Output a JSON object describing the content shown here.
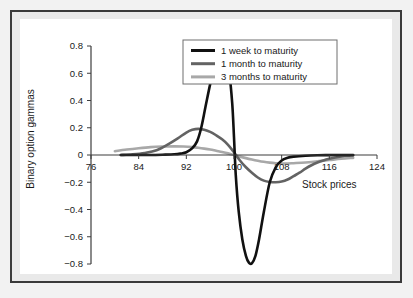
{
  "chart_data": {
    "type": "line",
    "title": "",
    "xlabel": "Stock prices",
    "ylabel": "Binary option gammas",
    "xlim": [
      76,
      124
    ],
    "ylim": [
      -0.8,
      0.8
    ],
    "grid": false,
    "legend_position": "top-right",
    "xticks": [
      "76",
      "84",
      "92",
      "100",
      "108",
      "116",
      "124"
    ],
    "xtick_values": [
      76,
      84,
      92,
      100,
      108,
      116,
      124
    ],
    "yticks": [
      "0.8",
      "0.6",
      "0.4",
      "0.2",
      "0",
      "-0.2",
      "-0.4",
      "-0.6",
      "-0.8"
    ],
    "ytick_values": [
      0.8,
      0.6,
      0.4,
      0.2,
      0,
      -0.2,
      -0.4,
      -0.6,
      -0.8
    ],
    "series": [
      {
        "name": "1 week to maturity",
        "color": "#111111",
        "width": 2.6,
        "x": [
          81,
          84,
          86,
          88,
          90,
          91,
          92,
          93,
          93.8,
          94.5,
          95.2,
          96,
          96.8,
          97.5,
          98,
          98.6,
          99.2,
          99.7,
          100,
          100.3,
          100.8,
          101.4,
          102,
          102.5,
          103,
          103.6,
          104.2,
          105,
          106,
          107,
          108,
          109,
          110,
          112,
          114,
          116,
          118,
          120
        ],
        "y": [
          0.0,
          0.0,
          0.0,
          0.002,
          0.005,
          0.01,
          0.02,
          0.05,
          0.1,
          0.2,
          0.35,
          0.52,
          0.67,
          0.745,
          0.752,
          0.72,
          0.6,
          0.38,
          0.13,
          -0.15,
          -0.42,
          -0.62,
          -0.74,
          -0.79,
          -0.795,
          -0.74,
          -0.62,
          -0.42,
          -0.2,
          -0.09,
          -0.04,
          -0.02,
          -0.012,
          -0.005,
          -0.002,
          -0.001,
          0.0,
          0.0
        ]
      },
      {
        "name": "1 month to maturity",
        "color": "#636363",
        "width": 2.6,
        "x": [
          81,
          83,
          85,
          87,
          89,
          90.5,
          92,
          93,
          94,
          95,
          96,
          97,
          98,
          99,
          100,
          101,
          102,
          103,
          104,
          105,
          106,
          107,
          108,
          109,
          110,
          111,
          112,
          113,
          114,
          115,
          116,
          117,
          118,
          119,
          120
        ],
        "y": [
          0.0,
          0.005,
          0.015,
          0.035,
          0.08,
          0.12,
          0.165,
          0.185,
          0.192,
          0.185,
          0.17,
          0.145,
          0.115,
          0.075,
          0.02,
          -0.04,
          -0.09,
          -0.13,
          -0.165,
          -0.188,
          -0.198,
          -0.2,
          -0.195,
          -0.18,
          -0.155,
          -0.13,
          -0.1,
          -0.075,
          -0.055,
          -0.04,
          -0.028,
          -0.018,
          -0.011,
          -0.006,
          -0.003
        ]
      },
      {
        "name": "3 months to maturity",
        "color": "#a8a8a8",
        "width": 2.6,
        "x": [
          80,
          82,
          84,
          86,
          88,
          90,
          91.5,
          93,
          94,
          95,
          96,
          97,
          98,
          99,
          100,
          101,
          102,
          103,
          104,
          105,
          106,
          107,
          108,
          109,
          110,
          112,
          114,
          116,
          118,
          120
        ],
        "y": [
          0.028,
          0.04,
          0.05,
          0.058,
          0.062,
          0.063,
          0.062,
          0.058,
          0.053,
          0.047,
          0.04,
          0.031,
          0.022,
          0.012,
          0.0,
          -0.012,
          -0.023,
          -0.033,
          -0.042,
          -0.05,
          -0.056,
          -0.06,
          -0.062,
          -0.062,
          -0.06,
          -0.055,
          -0.046,
          -0.037,
          -0.028,
          -0.021
        ]
      }
    ]
  },
  "figure": {
    "frame_color": "#3a3a3a",
    "background_color": "#f2f2f2",
    "plot_background": "#ffffff"
  }
}
